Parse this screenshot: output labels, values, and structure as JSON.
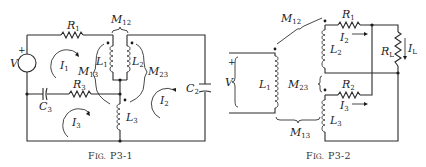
{
  "figures": [
    {
      "id": "P3-1",
      "caption": {
        "prefix": "F",
        "rest": "IG.",
        "number": "P3-1"
      },
      "components": {
        "source": {
          "label": "V",
          "polarity": "+"
        },
        "R1": {
          "base": "R",
          "sub": "1"
        },
        "R3": {
          "base": "R",
          "sub": "3"
        },
        "C2": {
          "base": "C",
          "sub": "2"
        },
        "C3": {
          "base": "C",
          "sub": "3"
        },
        "L1": {
          "base": "L",
          "sub": "1"
        },
        "L2": {
          "base": "L",
          "sub": "2"
        },
        "L3": {
          "base": "L",
          "sub": "3"
        },
        "M12": {
          "base": "M",
          "sub": "12"
        },
        "M13": {
          "base": "M",
          "sub": "13"
        },
        "M23": {
          "base": "M",
          "sub": "23"
        }
      },
      "mesh_currents": [
        {
          "base": "I",
          "sub": "1"
        },
        {
          "base": "I",
          "sub": "2"
        },
        {
          "base": "I",
          "sub": "3"
        }
      ]
    },
    {
      "id": "P3-2",
      "caption": {
        "prefix": "F",
        "rest": "IG.",
        "number": "P3-2"
      },
      "components": {
        "source": {
          "label": "V",
          "polarity": "+"
        },
        "R1": {
          "base": "R",
          "sub": "1"
        },
        "R2": {
          "base": "R",
          "sub": "2"
        },
        "RL": {
          "base": "R",
          "sub": "L"
        },
        "L1": {
          "base": "L",
          "sub": "1"
        },
        "L2": {
          "base": "L",
          "sub": "2"
        },
        "L3": {
          "base": "L",
          "sub": "3"
        },
        "M12": {
          "base": "M",
          "sub": "12"
        },
        "M13": {
          "base": "M",
          "sub": "13"
        },
        "M23": {
          "base": "M",
          "sub": "23"
        }
      },
      "branch_currents": [
        {
          "base": "I",
          "sub": "2"
        },
        {
          "base": "I",
          "sub": "3"
        },
        {
          "base": "I",
          "sub": "L"
        }
      ]
    }
  ]
}
